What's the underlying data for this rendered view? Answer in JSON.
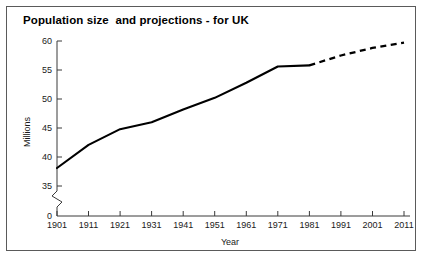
{
  "figure": {
    "title": "Population size  and projections - for UK",
    "border_color": "#5a5a5a",
    "background": "#ffffff",
    "line_color": "#000000"
  },
  "chart_data": {
    "type": "line",
    "title": "Population size  and projections - for UK",
    "xlabel": "Year",
    "ylabel": "Millions",
    "x": [
      1901,
      1911,
      1921,
      1931,
      1941,
      1951,
      1961,
      1971,
      1981,
      1991,
      2001,
      2011
    ],
    "categories": [
      "1901",
      "1911",
      "1921",
      "1931",
      "1941",
      "1951",
      "1961",
      "1971",
      "1981",
      "1991",
      "2001",
      "2011"
    ],
    "xlim": [
      1901,
      2011
    ],
    "ylim": [
      35,
      60
    ],
    "yticks": [
      0,
      35,
      40,
      45,
      50,
      55,
      60
    ],
    "ytick_labels": [
      "0",
      "35",
      "40",
      "45",
      "50",
      "55",
      "60"
    ],
    "y_axis_break": true,
    "y_axis_break_between": [
      0,
      35
    ],
    "grid": false,
    "legend": null,
    "series": [
      {
        "name": "Population size",
        "style": "solid",
        "x": [
          1901,
          1911,
          1921,
          1931,
          1941,
          1951,
          1961,
          1971,
          1981
        ],
        "values": [
          38.1,
          42.1,
          44.8,
          46.0,
          48.2,
          50.2,
          52.8,
          55.6,
          55.8
        ]
      },
      {
        "name": "Projections",
        "style": "dashed",
        "x": [
          1981,
          1991,
          2001,
          2011
        ],
        "values": [
          55.8,
          57.5,
          58.8,
          59.7
        ]
      }
    ],
    "annotations": []
  },
  "axes": {
    "y_tick_0": "0",
    "y_tick_35": "35",
    "y_tick_40": "40",
    "y_tick_45": "45",
    "y_tick_50": "50",
    "y_tick_55": "55",
    "y_tick_60": "60",
    "x_tick_1901": "1901",
    "x_tick_1911": "1911",
    "x_tick_1921": "1921",
    "x_tick_1931": "1931",
    "x_tick_1941": "1941",
    "x_tick_1951": "1951",
    "x_tick_1961": "1961",
    "x_tick_1971": "1971",
    "x_tick_1981": "1981",
    "x_tick_1991": "1991",
    "x_tick_2001": "2001",
    "x_tick_2011": "2011",
    "x_axis_title": "Year",
    "y_axis_title": "Millions"
  }
}
